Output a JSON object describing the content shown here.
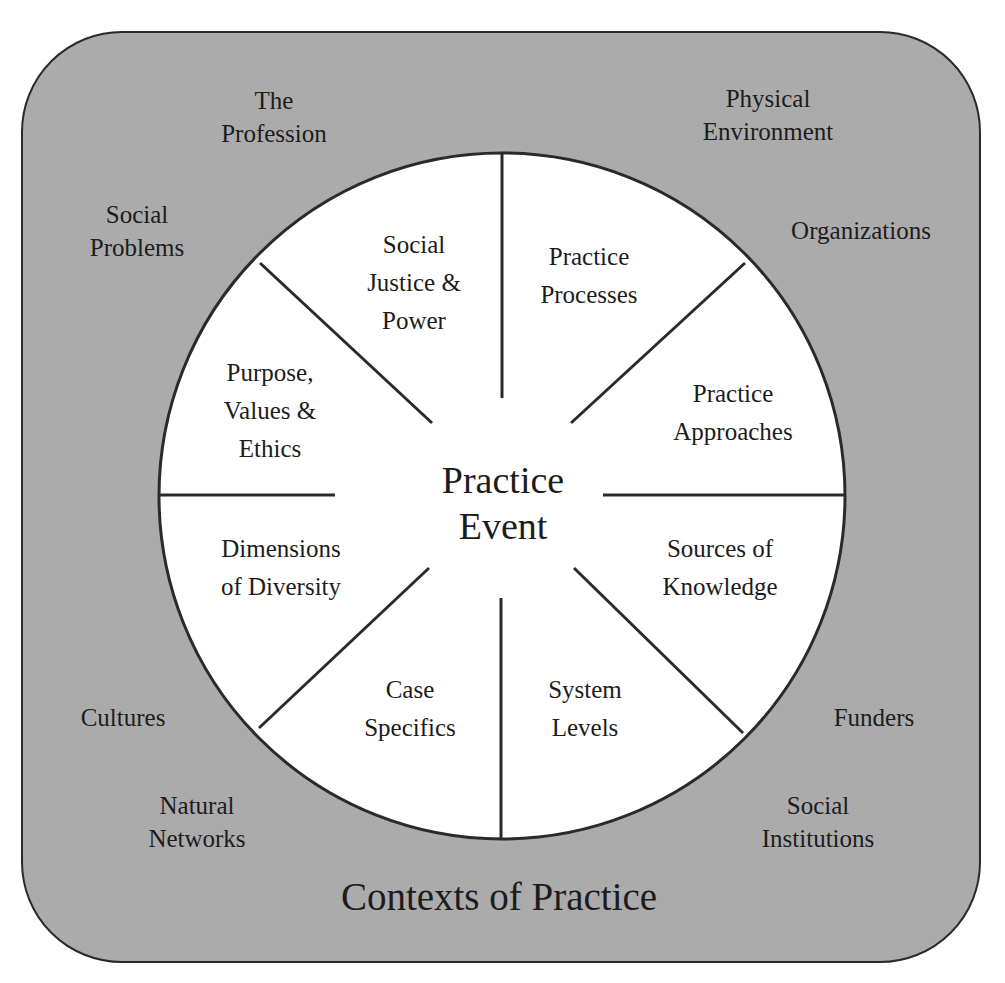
{
  "title": "Contexts of Practice",
  "center": {
    "lines": [
      "Practice",
      "Event"
    ]
  },
  "segments": [
    {
      "id": "social-justice-power",
      "lines": [
        "Social",
        "Justice &",
        "Power"
      ],
      "x": 414,
      "y": 283
    },
    {
      "id": "practice-processes",
      "lines": [
        "Practice",
        "Processes"
      ],
      "x": 589,
      "y": 276
    },
    {
      "id": "practice-approaches",
      "lines": [
        "Practice",
        "Approaches"
      ],
      "x": 733,
      "y": 413
    },
    {
      "id": "sources-of-knowledge",
      "lines": [
        "Sources of",
        "Knowledge"
      ],
      "x": 720,
      "y": 568
    },
    {
      "id": "system-levels",
      "lines": [
        "System",
        "Levels"
      ],
      "x": 585,
      "y": 709
    },
    {
      "id": "case-specifics",
      "lines": [
        "Case",
        "Specifics"
      ],
      "x": 410,
      "y": 709
    },
    {
      "id": "dimensions-of-diversity",
      "lines": [
        "Dimensions",
        "of Diversity"
      ],
      "x": 281,
      "y": 568
    },
    {
      "id": "purpose-values-ethics",
      "lines": [
        "Purpose,",
        "Values &",
        "Ethics"
      ],
      "x": 270,
      "y": 411
    }
  ],
  "contexts": [
    {
      "id": "the-profession",
      "lines": [
        "The",
        "Profession"
      ],
      "x": 274,
      "y": 117
    },
    {
      "id": "physical-environment",
      "lines": [
        "Physical",
        "Environment"
      ],
      "x": 768,
      "y": 115
    },
    {
      "id": "social-problems",
      "lines": [
        "Social",
        "Problems"
      ],
      "x": 137,
      "y": 231
    },
    {
      "id": "organizations",
      "lines": [
        "Organizations"
      ],
      "x": 861,
      "y": 231
    },
    {
      "id": "cultures",
      "lines": [
        "Cultures"
      ],
      "x": 123,
      "y": 718
    },
    {
      "id": "funders",
      "lines": [
        "Funders"
      ],
      "x": 874,
      "y": 718
    },
    {
      "id": "natural-networks",
      "lines": [
        "Natural",
        "Networks"
      ],
      "x": 197,
      "y": 822
    },
    {
      "id": "social-institutions",
      "lines": [
        "Social",
        "Institutions"
      ],
      "x": 818,
      "y": 822
    }
  ],
  "colors": {
    "outer_fill": "#ababab",
    "outer_stroke": "#2a2a2a",
    "circle_fill": "#ffffff",
    "line_color": "#2a2a2a",
    "text_color": "#1c1c1c"
  }
}
